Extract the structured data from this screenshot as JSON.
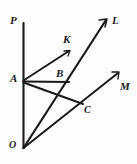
{
  "figure": {
    "type": "geometry-diagram",
    "background_color": "#fdfdfd",
    "stroke_color": "#1a1a1a",
    "canvas": {
      "width": 137,
      "height": 164
    },
    "points": [
      {
        "name": "O",
        "label": "O",
        "x": 23,
        "y": 148
      },
      {
        "name": "A",
        "label": "A",
        "x": 23,
        "y": 81
      },
      {
        "name": "B",
        "label": "B",
        "x": 68,
        "y": 82
      },
      {
        "name": "C",
        "label": "C",
        "x": 82,
        "y": 104
      },
      {
        "name": "P",
        "label": "P",
        "x": 23,
        "y": 23
      },
      {
        "name": "K",
        "label": "K",
        "x": 69,
        "y": 51
      },
      {
        "name": "L",
        "label": "L",
        "x": 106,
        "y": 19
      },
      {
        "name": "M",
        "label": "M",
        "x": 118,
        "y": 72
      }
    ],
    "segments": [
      {
        "name": "ray-OP",
        "from": "O",
        "to": "P",
        "arrow": false
      },
      {
        "name": "ray-OL",
        "from": "O",
        "to": "L",
        "arrow": true
      },
      {
        "name": "ray-OM",
        "from": "O",
        "to": "M",
        "arrow": true
      },
      {
        "name": "ray-AK",
        "from": "A",
        "to": "K",
        "arrow": true
      },
      {
        "name": "segment-AB",
        "from": "A",
        "to": "B",
        "arrow": false
      },
      {
        "name": "segment-AC",
        "from": "A",
        "to": "C",
        "arrow": false
      }
    ],
    "labels": {
      "P": "P",
      "K": "K",
      "L": "L",
      "A": "A",
      "B": "B",
      "M": "M",
      "C": "C",
      "O": "O"
    }
  }
}
